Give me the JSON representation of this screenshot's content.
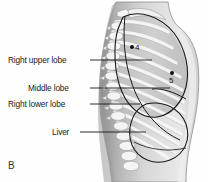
{
  "figure": {
    "panel_label": "B",
    "view": "right lateral thorax",
    "background_color": "#fefefe",
    "line_color": "#1a1a1a"
  },
  "labels": [
    {
      "id": "right-upper-lobe",
      "text": "Right upper lobe",
      "x": 8,
      "y": 56,
      "leader_from_x": 90,
      "leader_to_x": 152,
      "leader_y": 60
    },
    {
      "id": "middle-lobe",
      "text": "Middle lobe",
      "x": 28,
      "y": 84,
      "leader_from_x": 90,
      "leader_to_x": 170,
      "leader_y": 88
    },
    {
      "id": "right-lower-lobe",
      "text": "Right lower lobe",
      "x": 8,
      "y": 100,
      "leader_from_x": 90,
      "leader_to_x": 140,
      "leader_y": 104
    },
    {
      "id": "liver",
      "text": "Liver",
      "x": 52,
      "y": 128,
      "leader_from_x": 80,
      "leader_to_x": 146,
      "leader_y": 132
    }
  ],
  "markers": [
    {
      "id": "marker-4",
      "number": "4",
      "dot_x": 132,
      "dot_y": 47,
      "text_x": 135,
      "text_y": 43
    },
    {
      "id": "marker-5",
      "number": "5",
      "dot_x": 172,
      "dot_y": 73,
      "text_x": 169,
      "text_y": 76
    }
  ],
  "anatomy": {
    "torso_fill": "#d9d9d9",
    "lung_field_fill": "#c9c9c9",
    "rib_fill": "#f2f2f2",
    "vertebra_fill": "#f4f4f4",
    "skin_edge": "#9a9a9a",
    "parts": [
      "body outline",
      "vertebral column",
      "ribs",
      "lung outline",
      "oblique fissure",
      "horizontal fissure",
      "liver outline"
    ]
  }
}
